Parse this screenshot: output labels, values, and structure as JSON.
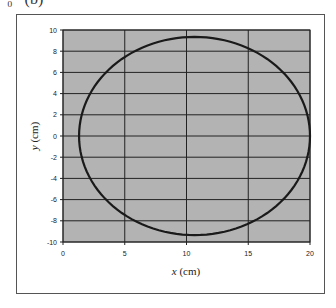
{
  "page": {
    "clipped_text": "=₀   (b)"
  },
  "colors": {
    "plot_background": "#b3b3b3",
    "gridline": "#222222",
    "curve": "#1a1a1a",
    "frame": "#555555"
  },
  "chart_data": {
    "type": "line",
    "title": "",
    "xlabel_var": "x",
    "xlabel_unit": " (cm)",
    "ylabel_var": "y",
    "ylabel_unit": " (cm)",
    "xlim": [
      0,
      20
    ],
    "ylim": [
      -10,
      10
    ],
    "x_ticks": [
      0,
      5,
      10,
      15,
      20
    ],
    "y_ticks": [
      10,
      8,
      6,
      4,
      2,
      0,
      -2,
      -4,
      -6,
      -8,
      -10
    ],
    "grid": true,
    "legend": null,
    "series": [
      {
        "name": "orbit",
        "shape": "closed ellipse (near-circle)",
        "center": [
          10.65,
          0
        ],
        "semi_axis_x": 9.35,
        "semi_axis_y": 9.35,
        "x": [
          20.0,
          19.72,
          18.9,
          17.6,
          15.9,
          13.9,
          11.71,
          9.59,
          7.4,
          5.4,
          3.7,
          2.4,
          1.58,
          1.3,
          1.58,
          2.4,
          3.7,
          5.4,
          7.4,
          9.59,
          11.71,
          13.9,
          15.9,
          17.6,
          18.9,
          19.72,
          20.0
        ],
        "y": [
          0,
          2.42,
          4.68,
          6.61,
          8.1,
          9.03,
          9.29,
          9.29,
          9.03,
          8.1,
          6.61,
          4.68,
          2.42,
          0,
          -2.42,
          -4.68,
          -6.61,
          -8.1,
          -9.03,
          -9.29,
          -9.29,
          -9.03,
          -8.1,
          -6.61,
          -4.68,
          -2.42,
          0
        ]
      }
    ]
  }
}
